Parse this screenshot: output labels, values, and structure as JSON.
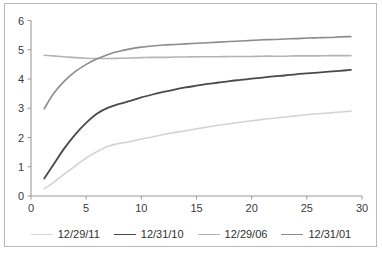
{
  "chart_data": {
    "type": "line",
    "title": "",
    "xlabel": "",
    "ylabel": "",
    "xlim": [
      0,
      30
    ],
    "ylim": [
      0,
      6
    ],
    "xticks": [
      0,
      5,
      10,
      15,
      20,
      25,
      30
    ],
    "yticks": [
      0,
      1,
      2,
      3,
      4,
      5,
      6
    ],
    "grid": false,
    "legend_position": "bottom",
    "x": [
      1.2,
      2,
      3,
      4,
      5,
      6,
      7,
      8,
      9,
      10,
      11,
      12,
      13,
      14,
      15,
      16,
      17,
      18,
      19,
      20,
      21,
      22,
      23,
      24,
      25,
      26,
      27,
      28,
      29
    ],
    "series": [
      {
        "name": "12/29/11",
        "color": "#d3d3d3",
        "width": 1.6,
        "values": [
          0.25,
          0.45,
          0.75,
          1.02,
          1.3,
          1.52,
          1.7,
          1.8,
          1.86,
          1.95,
          2.02,
          2.1,
          2.17,
          2.23,
          2.3,
          2.36,
          2.42,
          2.47,
          2.52,
          2.57,
          2.62,
          2.66,
          2.7,
          2.74,
          2.78,
          2.81,
          2.84,
          2.87,
          2.9
        ]
      },
      {
        "name": "12/31/10",
        "color": "#4a4a4a",
        "width": 1.8,
        "values": [
          0.6,
          1.05,
          1.62,
          2.1,
          2.5,
          2.82,
          3.02,
          3.15,
          3.25,
          3.37,
          3.47,
          3.56,
          3.64,
          3.71,
          3.77,
          3.83,
          3.88,
          3.93,
          3.97,
          4.01,
          4.05,
          4.09,
          4.12,
          4.16,
          4.19,
          4.22,
          4.25,
          4.28,
          4.31
        ]
      },
      {
        "name": "12/29/06",
        "color": "#b4b4b4",
        "width": 1.6,
        "values": [
          4.81,
          4.79,
          4.76,
          4.73,
          4.71,
          4.7,
          4.7,
          4.71,
          4.72,
          4.73,
          4.74,
          4.74,
          4.75,
          4.75,
          4.76,
          4.76,
          4.76,
          4.77,
          4.77,
          4.77,
          4.78,
          4.78,
          4.78,
          4.79,
          4.79,
          4.79,
          4.8,
          4.8,
          4.8
        ]
      },
      {
        "name": "12/31/01",
        "color": "#8c8c8c",
        "width": 1.6,
        "values": [
          2.98,
          3.48,
          3.92,
          4.25,
          4.5,
          4.69,
          4.84,
          4.95,
          5.03,
          5.09,
          5.13,
          5.16,
          5.18,
          5.2,
          5.22,
          5.24,
          5.26,
          5.28,
          5.3,
          5.32,
          5.34,
          5.35,
          5.37,
          5.38,
          5.4,
          5.41,
          5.42,
          5.44,
          5.45
        ]
      }
    ]
  },
  "legend": {
    "items": [
      {
        "label": "12/29/11",
        "color": "#d3d3d3",
        "width": 1.6
      },
      {
        "label": "12/31/10",
        "color": "#4a4a4a",
        "width": 1.8
      },
      {
        "label": "12/29/06",
        "color": "#b4b4b4",
        "width": 1.6
      },
      {
        "label": "12/31/01",
        "color": "#8c8c8c",
        "width": 1.6
      }
    ]
  }
}
